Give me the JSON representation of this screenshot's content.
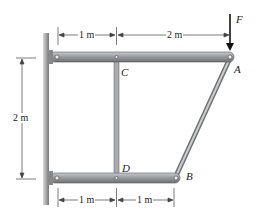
{
  "figure": {
    "labels": {
      "A": "A",
      "B": "B",
      "C": "C",
      "D": "D",
      "F": "F"
    },
    "dimensions": {
      "top_left": "1 m",
      "top_right": "2 m",
      "left_vertical": "2 m",
      "bottom_left": "1 m",
      "bottom_right": "1 m"
    },
    "colors": {
      "member": "#8a8d90",
      "member_highlight": "#c9cbcd",
      "wall": "#9a9a9a",
      "line": "#333333"
    }
  }
}
